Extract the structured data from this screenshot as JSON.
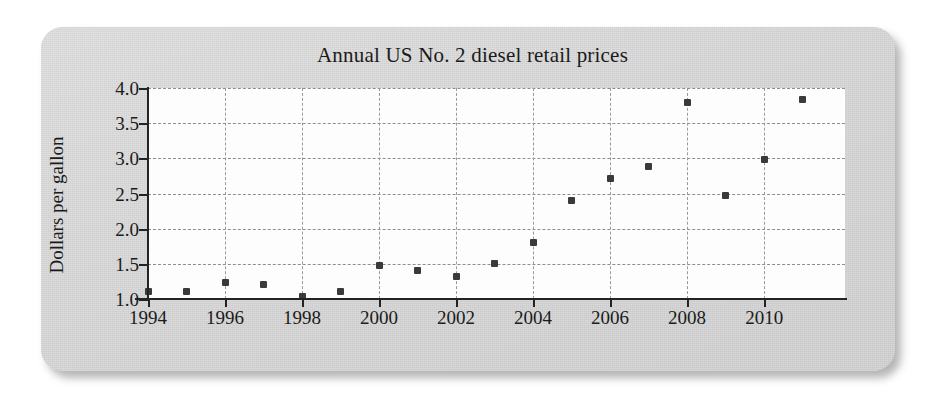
{
  "card": {
    "background_color": "#d6d6d6"
  },
  "chart_data": {
    "type": "scatter",
    "title": "Annual US No. 2 diesel retail prices",
    "xlabel": "",
    "ylabel": "Dollars per gallon",
    "x": [
      1994,
      1995,
      1996,
      1997,
      1998,
      1999,
      2000,
      2001,
      2002,
      2003,
      2004,
      2005,
      2006,
      2007,
      2008,
      2009,
      2010,
      2011
    ],
    "values": [
      1.11,
      1.1,
      1.24,
      1.2,
      1.04,
      1.11,
      1.47,
      1.4,
      1.32,
      1.51,
      1.81,
      2.4,
      2.71,
      2.88,
      3.8,
      2.47,
      2.99,
      3.84
    ],
    "xlim": [
      1994,
      2012.1
    ],
    "ylim": [
      1.0,
      4.0
    ],
    "xticks": [
      1994,
      1996,
      1998,
      2000,
      2002,
      2004,
      2006,
      2008,
      2010
    ],
    "xtick_labels": [
      "1994",
      "1996",
      "1998",
      "2000",
      "2002",
      "2004",
      "2006",
      "2008",
      "2010"
    ],
    "yticks": [
      1.0,
      1.5,
      2.0,
      2.5,
      3.0,
      3.5,
      4.0
    ],
    "ytick_labels": [
      "1.0",
      "1.5",
      "2.0",
      "2.5",
      "3.0",
      "3.5",
      "4.0"
    ],
    "grid": true,
    "grid_style": "dashed",
    "legend": null,
    "marker": "square",
    "marker_color": "#3a3a3a"
  }
}
